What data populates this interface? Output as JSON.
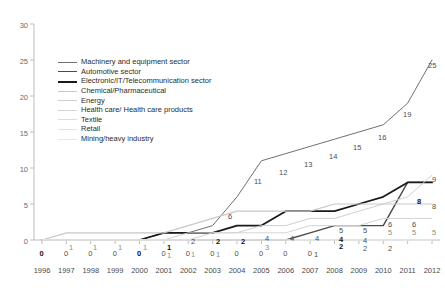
{
  "chart_data": {
    "type": "line",
    "title": "",
    "subtitle": "",
    "xlabel": "",
    "ylabel": "",
    "x": [
      1996,
      1997,
      1998,
      1999,
      2000,
      2001,
      2002,
      2003,
      2004,
      2005,
      2006,
      2007,
      2008,
      2009,
      2010,
      2011,
      2012
    ],
    "xlim": [
      1996,
      2012
    ],
    "ylim": [
      0,
      30
    ],
    "yticks": [
      0,
      5,
      10,
      15,
      20,
      25,
      30
    ],
    "xticks": [
      "1996",
      "1997",
      "1998",
      "1999",
      "2000",
      "2001",
      "2002",
      "2003",
      "2004",
      "2005",
      "2006",
      "2007",
      "2008",
      "2009",
      "2010",
      "2011",
      "2012"
    ],
    "grid": false,
    "legend_position": "upper-left-inside",
    "series": [
      {
        "name": "Machinery and equipment sector",
        "color": "#707070",
        "width": 1.0,
        "values": [
          0,
          0,
          0,
          0,
          0,
          1,
          1,
          2,
          6,
          11,
          12,
          13,
          14,
          15,
          16,
          19,
          25
        ],
        "labels": [
          "0",
          "0",
          "0",
          "0",
          "0",
          "1",
          "1",
          "2",
          "6",
          "11",
          "12",
          "13",
          "14",
          "15",
          "16",
          "19",
          "25"
        ]
      },
      {
        "name": "Automotive sector",
        "color": "#4a4a4a",
        "width": 1.4,
        "values": [
          0,
          0,
          0,
          0,
          0,
          0,
          0,
          0,
          0,
          0,
          0,
          1,
          2,
          2,
          2,
          8,
          8
        ],
        "labels": [
          "0",
          "0",
          "0",
          "0",
          "0",
          "0",
          "0",
          "0",
          "0",
          "0",
          "0",
          "1",
          "2",
          "2",
          "2",
          "8",
          "8"
        ]
      },
      {
        "name": "Electronic/IT/Telecommunication sector",
        "color": "#1a1a1a",
        "width": 1.8,
        "values": [
          0,
          0,
          0,
          0,
          0,
          1,
          1,
          1,
          2,
          2,
          4,
          4,
          4,
          5,
          6,
          8,
          8
        ],
        "labels": [
          "0",
          "0",
          "0",
          "0",
          "0",
          "1",
          "1",
          "1",
          "2",
          "2",
          "4",
          "4",
          "4",
          "5",
          "6",
          "8",
          "8"
        ]
      },
      {
        "name": "Chemical/Pharmaceutical",
        "color": "#c8c8c8",
        "width": 1.2,
        "values": [
          0,
          1,
          1,
          1,
          1,
          1,
          2,
          3,
          4,
          4,
          4,
          4,
          5,
          5,
          5,
          5,
          5
        ],
        "labels": [
          "0",
          "1",
          "1",
          "1",
          "1",
          "1",
          "2",
          "3",
          "4",
          "4",
          "4",
          "4",
          "5",
          "5",
          "5",
          "5",
          "5"
        ]
      },
      {
        "name": "Energy",
        "color": "#cfcfcf",
        "width": 1.0,
        "values": [
          0,
          0,
          0,
          0,
          0,
          0,
          1,
          1,
          1,
          2,
          2,
          3,
          3,
          4,
          5,
          6,
          9
        ],
        "labels": [
          "",
          "",
          "",
          "",
          "",
          "",
          "1",
          "1",
          "",
          "",
          "",
          "",
          "",
          "",
          "",
          "6",
          "9"
        ]
      },
      {
        "name": "Health care/ Health care products",
        "color": "#d4d4d4",
        "width": 1.0,
        "values": [
          0,
          0,
          0,
          0,
          0,
          0,
          0,
          1,
          1,
          1,
          1,
          2,
          2,
          2,
          3,
          3,
          3
        ],
        "labels": [
          "",
          "",
          "",
          "",
          "",
          "",
          "",
          "",
          "",
          "",
          "",
          "",
          "",
          "2",
          "2",
          "",
          ""
        ]
      },
      {
        "name": "Textile",
        "color": "#dcdcdc",
        "width": 1.0,
        "values": [
          0,
          0,
          0,
          0,
          0,
          0,
          0,
          0,
          0,
          0,
          0,
          0,
          0,
          0,
          0,
          0,
          0
        ],
        "labels": [
          "",
          "",
          "",
          "",
          "",
          "",
          "",
          "",
          "",
          "",
          "",
          "",
          "",
          "",
          "",
          "",
          ""
        ]
      },
      {
        "name": "Retail",
        "color": "#e2e2e2",
        "width": 1.0,
        "values": [
          0,
          0,
          0,
          0,
          0,
          0,
          0,
          0,
          0,
          0,
          0,
          0,
          0,
          0,
          0,
          0,
          0
        ],
        "labels": [
          "",
          "",
          "",
          "",
          "",
          "",
          "",
          "",
          "",
          "",
          "",
          "",
          "",
          "",
          "",
          "",
          ""
        ]
      },
      {
        "name": "Mining/heavy industry",
        "color": "#e8e8e8",
        "width": 1.0,
        "values": [
          0,
          0,
          0,
          0,
          0,
          0,
          0,
          0,
          0,
          0,
          0,
          0,
          0,
          0,
          0,
          0,
          0
        ],
        "labels": [
          "",
          "",
          "",
          "",
          "",
          "",
          "",
          "",
          "",
          "",
          "",
          "",
          "",
          "",
          "",
          "",
          ""
        ]
      }
    ],
    "annotations": {
      "zero_row": [
        "0",
        "0",
        "0",
        "0",
        "0",
        "0",
        "0",
        "0",
        "0",
        "0",
        "0",
        "0"
      ],
      "baseline_labels": [
        {
          "text": "0",
          "x": 1996,
          "style": "bold"
        },
        {
          "text": "0",
          "x": 1997,
          "style": "mid"
        },
        {
          "text": "0",
          "x": 1998,
          "style": "mid"
        },
        {
          "text": "0",
          "x": 1999,
          "style": "mid"
        },
        {
          "text": "0",
          "x": 2000,
          "style": "bold"
        },
        {
          "text": "0",
          "x": 2001,
          "style": "mid"
        },
        {
          "text": "0",
          "x": 2002,
          "style": "mid"
        },
        {
          "text": "0",
          "x": 2003,
          "style": "mid"
        },
        {
          "text": "0",
          "x": 2004,
          "style": "mid"
        },
        {
          "text": "0",
          "x": 2005,
          "style": "mid"
        },
        {
          "text": "0",
          "x": 2006,
          "style": "mid"
        },
        {
          "text": "0",
          "x": 2007,
          "style": "mid"
        }
      ]
    }
  },
  "axes": {
    "y_labels": [
      "30",
      "25",
      "20",
      "15",
      "10",
      "5",
      "0"
    ],
    "x_labels": [
      "1996",
      "1997",
      "1998",
      "1999",
      "2000",
      "2001",
      "2002",
      "2003",
      "2004",
      "2005",
      "2006",
      "2007",
      "2008",
      "2009",
      "2010",
      "2011",
      "2012"
    ],
    "axis_color": "#b5b5b5",
    "label_color": "#6b6b6b"
  },
  "legend": {
    "items": [
      {
        "label": "Machinery and equipment sector",
        "color": "#707070",
        "width": 1.0
      },
      {
        "label": "Automotive sector",
        "color": "#4a4a4a",
        "width": 1.5
      },
      {
        "label": "Electronic/IT/Telecommunication sector",
        "color": "#1a1a1a",
        "width": 2.0
      },
      {
        "label": "Chemical/Pharmaceutical",
        "color": "#c8c8c8",
        "width": 1.2
      },
      {
        "label": "Energy",
        "color": "#cfcfcf",
        "width": 1.0
      },
      {
        "label": "Health care/ Health care products",
        "color": "#d4d4d4",
        "width": 1.0
      },
      {
        "label": "Textile",
        "color": "#dcdcdc",
        "width": 1.0
      },
      {
        "label": "Retail",
        "color": "#e2e2e2",
        "width": 1.0
      },
      {
        "label": "Mining/heavy industry",
        "color": "#e8e8e8",
        "width": 1.0
      }
    ]
  },
  "data_labels": [
    {
      "text": "1",
      "x": 69,
      "y": 243,
      "style": "faint"
    },
    {
      "text": "1",
      "x": 93,
      "y": 243,
      "style": "faint"
    },
    {
      "text": "1",
      "x": 118,
      "y": 243,
      "style": "faint"
    },
    {
      "text": "1",
      "x": 143,
      "y": 243,
      "style": "faint"
    },
    {
      "text": "1",
      "x": 167,
      "y": 243,
      "style": "bold"
    },
    {
      "text": "1",
      "x": 167,
      "y": 251,
      "style": "faint"
    },
    {
      "text": "2",
      "x": 191,
      "y": 237,
      "style": "mid"
    },
    {
      "text": "1",
      "x": 191,
      "y": 250,
      "style": "faint"
    },
    {
      "text": "2",
      "x": 216,
      "y": 237,
      "style": "bold"
    },
    {
      "text": "1",
      "x": 216,
      "y": 250,
      "style": "faint"
    },
    {
      "text": "2",
      "x": 241,
      "y": 237,
      "style": "bold"
    },
    {
      "text": "6",
      "x": 228,
      "y": 212,
      "style": "mid"
    },
    {
      "text": "3",
      "x": 265,
      "y": 243,
      "style": "faint"
    },
    {
      "text": "4",
      "x": 265,
      "y": 234,
      "style": "mid"
    },
    {
      "text": "4",
      "x": 290,
      "y": 234,
      "style": "mid"
    },
    {
      "text": "4",
      "x": 315,
      "y": 234,
      "style": "mid"
    },
    {
      "text": "11",
      "x": 254,
      "y": 177,
      "style": "mid"
    },
    {
      "text": "12",
      "x": 279,
      "y": 168,
      "style": "mid"
    },
    {
      "text": "13",
      "x": 304,
      "y": 160,
      "style": "mid"
    },
    {
      "text": "14",
      "x": 329,
      "y": 152,
      "style": "mid"
    },
    {
      "text": "15",
      "x": 353,
      "y": 143,
      "style": "mid"
    },
    {
      "text": "16",
      "x": 378,
      "y": 133,
      "style": "mid"
    },
    {
      "text": "19",
      "x": 403,
      "y": 110,
      "style": "mid"
    },
    {
      "text": "25",
      "x": 428,
      "y": 61,
      "style": "mid"
    },
    {
      "text": "1",
      "x": 314,
      "y": 250,
      "style": "mid"
    },
    {
      "text": "2",
      "x": 339,
      "y": 242,
      "style": "bold"
    },
    {
      "text": "2",
      "x": 363,
      "y": 244,
      "style": "mid"
    },
    {
      "text": "2",
      "x": 388,
      "y": 244,
      "style": "mid"
    },
    {
      "text": "5",
      "x": 339,
      "y": 226,
      "style": "mid"
    },
    {
      "text": "4",
      "x": 339,
      "y": 235,
      "style": "bold"
    },
    {
      "text": "5",
      "x": 363,
      "y": 226,
      "style": "mid"
    },
    {
      "text": "4",
      "x": 363,
      "y": 236,
      "style": "mid"
    },
    {
      "text": "6",
      "x": 388,
      "y": 220,
      "style": "mid"
    },
    {
      "text": "5",
      "x": 388,
      "y": 228,
      "style": "faint"
    },
    {
      "text": "6",
      "x": 412,
      "y": 220,
      "style": "mid"
    },
    {
      "text": "5",
      "x": 412,
      "y": 228,
      "style": "faint"
    },
    {
      "text": "8",
      "x": 417,
      "y": 197,
      "style": "bold"
    },
    {
      "text": "9",
      "x": 432,
      "y": 175,
      "style": "mid"
    },
    {
      "text": "8",
      "x": 432,
      "y": 202,
      "style": "mid"
    },
    {
      "text": "5",
      "x": 432,
      "y": 228,
      "style": "faint"
    }
  ]
}
